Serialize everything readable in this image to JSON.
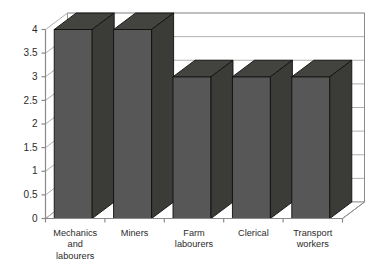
{
  "chart_data": {
    "type": "bar",
    "title": "",
    "subtitle": "",
    "xlabel": "",
    "ylabel": "",
    "categories": [
      "Mechanics and labourers",
      "Miners",
      "Farm labourers",
      "Clerical",
      "Transport workers"
    ],
    "category_lines": [
      [
        "Mechanics",
        "and",
        "labourers"
      ],
      [
        "Miners"
      ],
      [
        "Farm",
        "labourers"
      ],
      [
        "Clerical"
      ],
      [
        "Transport",
        "workers"
      ]
    ],
    "values": [
      4,
      4,
      3,
      3,
      3
    ],
    "ylim": [
      0,
      4
    ],
    "ytick_labels": [
      "0",
      "0.5",
      "1",
      "1.5",
      "2",
      "2.5",
      "3",
      "3.5",
      "4"
    ],
    "ytick_values": [
      0,
      0.5,
      1,
      1.5,
      2,
      2.5,
      3,
      3.5,
      4
    ],
    "grid": true,
    "grid_axis": "y",
    "legend": false,
    "legend_position": "none",
    "three_d": true,
    "annotations": []
  },
  "style": {
    "background": "#ffffff",
    "bar_front": "#575757",
    "bar_top": "#43433f",
    "bar_side": "#3b3b38",
    "bar_outline": "#111111",
    "grid_color": "#b0b0b0",
    "axis_color": "#8a8a8a",
    "wall_color": "#ffffff",
    "floor_color": "#ffffff",
    "text_color": "#2b2b2b"
  }
}
